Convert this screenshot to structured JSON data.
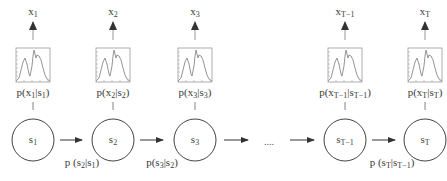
{
  "diagram": {
    "type": "hidden-markov-model",
    "columns": [
      {
        "id": "1",
        "state": "s",
        "state_sub": "1",
        "obs": "x",
        "obs_sub": "1",
        "emission": {
          "p": "p(x",
          "x_sub": "1",
          "mid": "|s",
          "s_sub": "1",
          "end": ")"
        }
      },
      {
        "id": "2",
        "state": "s",
        "state_sub": "2",
        "obs": "x",
        "obs_sub": "2",
        "emission": {
          "p": "p(x",
          "x_sub": "2",
          "mid": "|s",
          "s_sub": "2",
          "end": ")"
        }
      },
      {
        "id": "3",
        "state": "s",
        "state_sub": "3",
        "obs": "x",
        "obs_sub": "3",
        "emission": {
          "p": "p(x",
          "x_sub": "3",
          "mid": "|s",
          "s_sub": "3",
          "end": ")"
        }
      },
      {
        "id": "T-1",
        "state": "s",
        "state_sub": "T−1",
        "obs": "x",
        "obs_sub": "T−1",
        "emission": {
          "p": "p(x",
          "x_sub": "T−1",
          "mid": "|s",
          "s_sub": "T−1",
          "end": ")"
        }
      },
      {
        "id": "T",
        "state": "s",
        "state_sub": "T",
        "obs": "x",
        "obs_sub": "T",
        "emission": {
          "p": "p(x",
          "x_sub": "T",
          "mid": "|s",
          "s_sub": "T",
          "end": ")"
        }
      }
    ],
    "transitions": [
      {
        "p": "p (s",
        "a_sub": "2",
        "mid": "|s",
        "b_sub": "1",
        "end": ")"
      },
      {
        "p": "p(s",
        "a_sub": "3",
        "mid": "|s",
        "b_sub": "2",
        "end": ")"
      },
      {
        "p": "p (s",
        "a_sub": "T",
        "mid": "|s",
        "b_sub": "T−1",
        "end": ")"
      }
    ],
    "ellipsis": "....",
    "colors": {
      "stroke": "#444444",
      "plot_line": "#888888",
      "text": "#3a3a3a"
    }
  }
}
